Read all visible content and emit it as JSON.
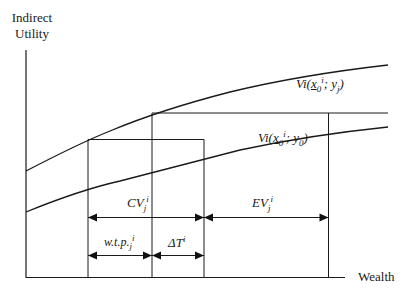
{
  "diagram": {
    "type": "economics-indirect-utility-diagram",
    "y_axis": {
      "title_line1": "Indirect",
      "title_line2": "Utility"
    },
    "x_axis": {
      "title": "Wealth"
    },
    "curves": [
      {
        "name": "upper",
        "label_main": "Vi(",
        "label_x": "x",
        "label_sub0": "0",
        "label_supi": "i",
        "label_rest": "; y",
        "label_subj": "j",
        "label_close": ")"
      },
      {
        "name": "lower",
        "label_main": "Vi(",
        "label_x": "x",
        "label_sub0": "0",
        "label_supi": "i",
        "label_rest": "; y",
        "label_sub0b": "0",
        "label_close": ")"
      }
    ],
    "measures": {
      "cv": {
        "main": "CV",
        "sub": "j",
        "sup": "i"
      },
      "ev": {
        "main": "EV",
        "sub": "j",
        "sup": "i"
      },
      "wtp": {
        "main": "w.t.p.",
        "sub": "j",
        "sup": "i"
      },
      "delta_t": {
        "main": "ΔT",
        "sup": "i"
      }
    },
    "colors": {
      "line": "#1a1a1a",
      "background": "#ffffff"
    }
  }
}
